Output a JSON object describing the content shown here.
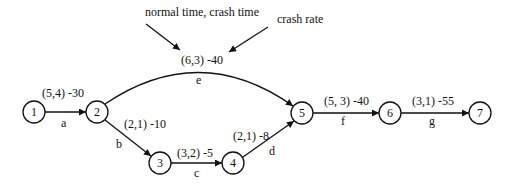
{
  "annotations": {
    "left": "normal time, crash time",
    "right": "crash rate"
  },
  "nodes": [
    {
      "id": "1",
      "x": 34,
      "y": 112
    },
    {
      "id": "2",
      "x": 97,
      "y": 112
    },
    {
      "id": "3",
      "x": 160,
      "y": 163
    },
    {
      "id": "4",
      "x": 233,
      "y": 163
    },
    {
      "id": "5",
      "x": 302,
      "y": 113
    },
    {
      "id": "6",
      "x": 390,
      "y": 113
    },
    {
      "id": "7",
      "x": 480,
      "y": 113
    }
  ],
  "edges": [
    {
      "name": "a",
      "from": "1",
      "to": "2",
      "times": "(5,4) -30"
    },
    {
      "name": "b",
      "from": "2",
      "to": "3",
      "times": "(2,1) -10"
    },
    {
      "name": "c",
      "from": "3",
      "to": "4",
      "times": "(3,2) -5"
    },
    {
      "name": "d",
      "from": "4",
      "to": "5",
      "times": "(2,1) -8"
    },
    {
      "name": "e",
      "from": "2",
      "to": "5",
      "times": "(6,3) -40"
    },
    {
      "name": "f",
      "from": "5",
      "to": "6",
      "times": "(5, 3) -40"
    },
    {
      "name": "g",
      "from": "6",
      "to": "7",
      "times": "(3,1) -55"
    }
  ]
}
